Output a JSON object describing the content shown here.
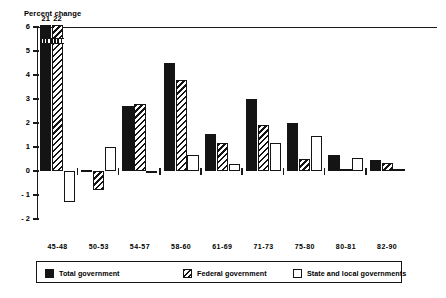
{
  "chart_data": {
    "type": "bar",
    "title": "Percent change",
    "xlabel": "",
    "ylabel": "Percent change",
    "ylim": [
      -2,
      6
    ],
    "yticks": [
      6,
      5,
      4,
      3,
      2,
      1,
      0,
      -1,
      -2
    ],
    "ytick_labels": [
      "6",
      "5",
      "4",
      "3",
      "2",
      "1",
      "0",
      "- 1",
      "- 2"
    ],
    "grid": false,
    "legend_position": "bottom",
    "categories": [
      "45-48",
      "50-53",
      "54-57",
      "58-60",
      "61-69",
      "71-73",
      "75-80",
      "80-81",
      "82-90"
    ],
    "series": [
      {
        "name": "Total government",
        "pattern": "solid-black",
        "color": "#141414",
        "values": [
          21,
          0.05,
          2.7,
          4.5,
          1.55,
          3.0,
          2.0,
          0.65,
          0.47
        ],
        "clipped": [
          true,
          false,
          false,
          false,
          false,
          false,
          false,
          false,
          false
        ],
        "clipped_label": "21"
      },
      {
        "name": "Federal government",
        "pattern": "diagonal-hatch",
        "color": "#141414",
        "values": [
          22,
          -0.8,
          2.8,
          3.8,
          1.15,
          1.9,
          0.5,
          0.08,
          0.33
        ],
        "clipped": [
          true,
          false,
          false,
          false,
          false,
          false,
          false,
          false,
          false
        ],
        "clipped_label": "22"
      },
      {
        "name": "State and local governments",
        "pattern": "open-white",
        "color": "#ffffff",
        "values": [
          -1.3,
          1.0,
          -0.07,
          0.65,
          0.3,
          1.15,
          1.45,
          0.55,
          0.07
        ],
        "clipped": [
          false,
          false,
          false,
          false,
          false,
          false,
          false,
          false,
          false
        ],
        "clipped_label": ""
      }
    ],
    "annotations": [
      {
        "text": "21",
        "target": "45-48 / Total government",
        "note": "bar truncated, actual value shown above axis top"
      },
      {
        "text": "22",
        "target": "45-48 / Federal government",
        "note": "bar truncated, actual value shown above axis top"
      }
    ]
  },
  "legend": {
    "items": [
      {
        "label": "Total government",
        "swatch": "solid-black-swatch"
      },
      {
        "label": "Federal government",
        "swatch": "hatched-swatch"
      },
      {
        "label": "State and local governments",
        "swatch": "open-white-swatch"
      }
    ]
  },
  "colors": {
    "ink": "#141414",
    "background": "#ffffff"
  }
}
